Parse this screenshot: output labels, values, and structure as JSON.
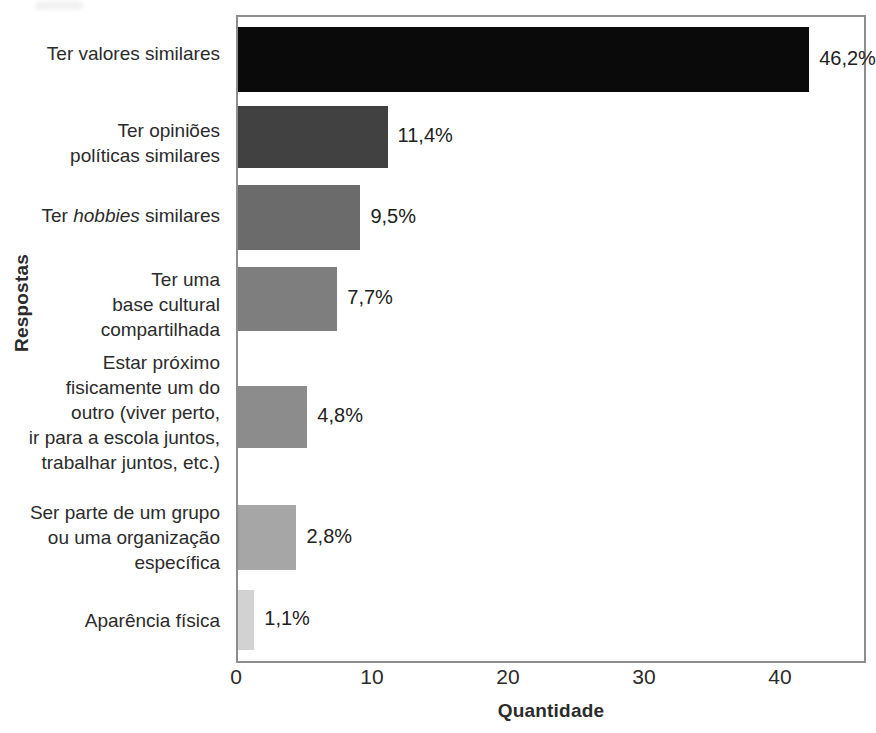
{
  "chart_data": {
    "type": "bar",
    "orientation": "horizontal",
    "title": "",
    "xlabel": "Quantidade",
    "ylabel": "Respostas",
    "xlim": [
      0,
      46.3
    ],
    "xticks": [
      0,
      10,
      20,
      30,
      40
    ],
    "grid": false,
    "legend": null,
    "categories": [
      "Ter valores similares",
      "Ter opiniões políticas similares",
      "Ter hobbies similares",
      "Ter uma base cultural compartilhada",
      "Estar próximo fisicamente um do outro (viver perto, ir para a escola juntos, trabalhar juntos, etc.)",
      "Ser parte de um grupo ou uma organização específica",
      "Aparência física"
    ],
    "values": [
      42,
      11,
      9,
      7.3,
      5.1,
      4.3,
      1.2
    ],
    "data_labels": [
      "46,2%",
      "11,4%",
      "9,5%",
      "7,7%",
      "4,8%",
      "2,8%",
      "1,1%"
    ],
    "percentages": [
      46.2,
      11.4,
      9.5,
      7.7,
      4.8,
      2.8,
      1.1
    ],
    "bar_colors": [
      "#0a0a0a",
      "#414141",
      "#6b6b6b",
      "#7e7e7e",
      "#8c8c8c",
      "#a6a6a6",
      "#d2d2d2"
    ]
  },
  "axes": {
    "y_title": "Respostas",
    "x_title": "Quantidade",
    "x_tick_labels": [
      "0",
      "10",
      "20",
      "30",
      "40"
    ]
  },
  "categories": [
    {
      "lines": [
        "Ter valores similares"
      ],
      "italic_word": ""
    },
    {
      "lines": [
        "Ter opiniões",
        "políticas similares"
      ],
      "italic_word": ""
    },
    {
      "lines": [
        "Ter |hobbies| similares"
      ],
      "italic_word": "hobbies"
    },
    {
      "lines": [
        "Ter uma",
        "base cultural",
        "compartilhada"
      ],
      "italic_word": ""
    },
    {
      "lines": [
        "Estar próximo",
        "fisicamente um do",
        "outro (viver perto,",
        "ir para a escola juntos,",
        "trabalhar juntos, etc.)"
      ],
      "italic_word": ""
    },
    {
      "lines": [
        "Ser parte de um grupo",
        "ou uma organização",
        "específica"
      ],
      "italic_word": ""
    },
    {
      "lines": [
        "Aparência física"
      ],
      "italic_word": ""
    }
  ],
  "value_labels": [
    "46,2%",
    "11,4%",
    "9,5%",
    "7,7%",
    "4,8%",
    "2,8%",
    "1,1%"
  ],
  "colors": {
    "frame": "#8e8e8e",
    "text": "#2b2b2b",
    "bar1": "#0a0a0a",
    "bar2": "#414141",
    "bar3": "#6b6b6b",
    "bar4": "#7e7e7e",
    "bar5": "#8c8c8c",
    "bar6": "#a6a6a6",
    "bar7": "#d2d2d2"
  }
}
